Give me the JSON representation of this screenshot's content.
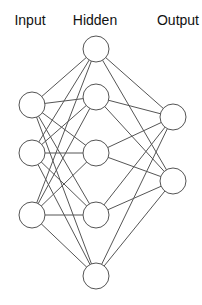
{
  "layers": [
    {
      "name": "Input",
      "x": 32,
      "label_x": 30,
      "nodes_y": [
        105,
        153,
        215
      ]
    },
    {
      "name": "Hidden",
      "x": 96,
      "label_x": 95,
      "nodes_y": [
        49,
        97,
        153,
        215,
        276
      ]
    },
    {
      "name": "Output",
      "x": 173,
      "label_x": 178,
      "nodes_y": [
        117,
        181
      ]
    }
  ],
  "node_radius": 13,
  "colors": {
    "stroke": "#555555",
    "fill": "#ffffff",
    "text": "#111111"
  }
}
